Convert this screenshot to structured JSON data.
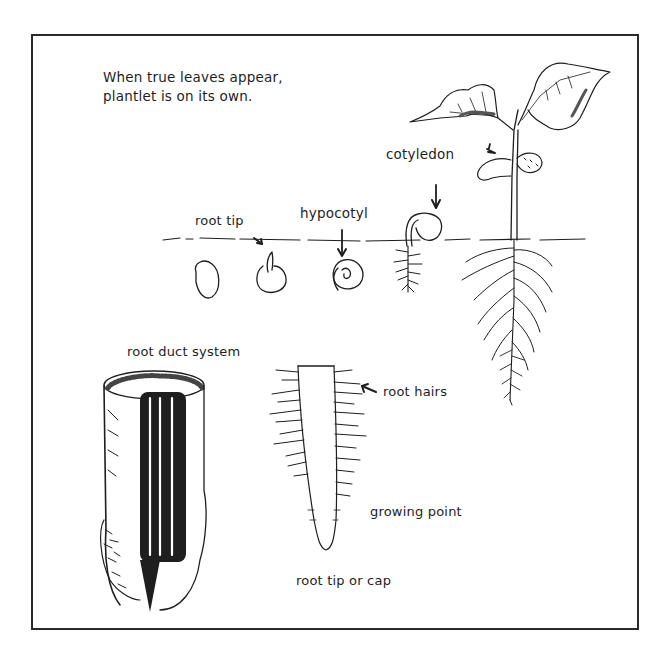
{
  "figure": {
    "note_lines": [
      "When true leaves appear,",
      "plantlet is on its own."
    ],
    "labels": {
      "cotyledon": "cotyledon",
      "root_tip": "root tip",
      "hypocotyl": "hypocotyl",
      "root_duct_system": "root duct system",
      "root_hairs": "root hairs",
      "growing_point": "growing point",
      "root_tip_or_cap": "root tip or cap"
    },
    "stages": [
      "seed",
      "root tip emerges",
      "hypocotyl hook",
      "cotyledons emerge",
      "plantlet with true leaves"
    ],
    "colors": {
      "ink": "#1e1e1e",
      "background": "#ffffff",
      "frame": "#2a2a2a"
    }
  }
}
